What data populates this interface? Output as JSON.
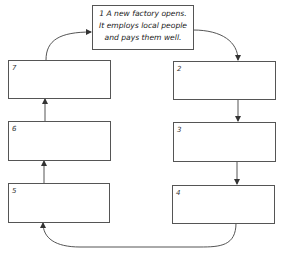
{
  "diagram": {
    "type": "cycle",
    "start_box": {
      "number": "1",
      "lines": [
        "1 A new factory opens.",
        "It employs local people",
        "and pays them well."
      ]
    },
    "boxes": [
      {
        "number": "2",
        "text": ""
      },
      {
        "number": "3",
        "text": ""
      },
      {
        "number": "4",
        "text": ""
      },
      {
        "number": "5",
        "text": ""
      },
      {
        "number": "6",
        "text": ""
      },
      {
        "number": "7",
        "text": ""
      }
    ],
    "flow": [
      "1",
      "2",
      "3",
      "4",
      "5",
      "6",
      "7",
      "1"
    ],
    "colors": {
      "line": "#555555",
      "text": "#222222",
      "background": "#ffffff"
    }
  }
}
